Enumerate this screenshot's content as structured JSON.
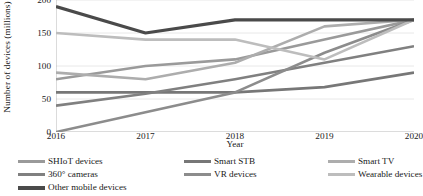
{
  "chart_data": {
    "type": "line",
    "title": "",
    "xlabel": "Year",
    "ylabel": "Number of devices (millions)",
    "categories": [
      "2016",
      "2017",
      "2018",
      "2019",
      "2020"
    ],
    "x": [
      2016,
      2017,
      2018,
      2019,
      2020
    ],
    "ylim": [
      0,
      200
    ],
    "yticks": [
      "0",
      "50",
      "100",
      "150",
      "200"
    ],
    "ytick_values": [
      0,
      50,
      100,
      150,
      200
    ],
    "grid": "horizontal",
    "legend_position": "bottom",
    "series": [
      {
        "name": "SHIoT  devices",
        "color": "#9a9a9a",
        "width": 2.6,
        "values": [
          80,
          100,
          110,
          140,
          170
        ]
      },
      {
        "name": "Smart STB",
        "color": "#777777",
        "width": 2.6,
        "values": [
          60,
          60,
          60,
          68,
          90
        ]
      },
      {
        "name": "Smart TV",
        "color": "#adadad",
        "width": 2.6,
        "values": [
          90,
          80,
          105,
          160,
          170
        ]
      },
      {
        "name": "360° cameras",
        "color": "#808080",
        "width": 2.6,
        "values": [
          40,
          58,
          80,
          105,
          130
        ]
      },
      {
        "name": "VR devices",
        "color": "#8c8c8c",
        "width": 2.6,
        "values": [
          0,
          30,
          60,
          120,
          170
        ]
      },
      {
        "name": "Wearable devices",
        "color": "#bdbdbd",
        "width": 2.6,
        "values": [
          150,
          140,
          140,
          110,
          170
        ]
      },
      {
        "name": "Other mobile devices",
        "color": "#4a4a4a",
        "width": 3.2,
        "values": [
          190,
          150,
          170,
          170,
          170
        ]
      }
    ]
  },
  "axes": {
    "ylabel": "Number of devices (millions)",
    "xlabel": "Year",
    "yticks": [
      "200",
      "150",
      "100",
      "50",
      "0"
    ],
    "xticks": [
      "2016",
      "2017",
      "2018",
      "2019",
      "2020"
    ]
  },
  "legend": {
    "items": [
      {
        "label": "SHIoT  devices",
        "color": "#9a9a9a"
      },
      {
        "label": "Smart STB",
        "color": "#777777"
      },
      {
        "label": "Smart TV",
        "color": "#adadad"
      },
      {
        "label": "360° cameras",
        "color": "#808080"
      },
      {
        "label": "VR devices",
        "color": "#8c8c8c"
      },
      {
        "label": "Wearable devices",
        "color": "#bdbdbd"
      },
      {
        "label": "Other mobile devices",
        "color": "#4a4a4a"
      }
    ]
  },
  "style": {
    "grid_color": "#e2e2e2",
    "axis_color": "#b0b0b0",
    "text_color": "#1a1a1a",
    "background": "#ffffff"
  }
}
